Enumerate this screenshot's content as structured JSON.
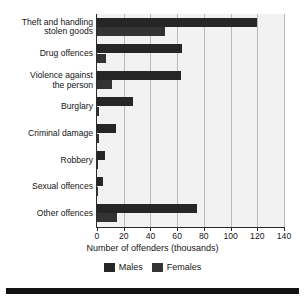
{
  "chart_data": {
    "type": "bar",
    "orientation": "horizontal",
    "title": "",
    "xlabel": "Number of offenders (thousands)",
    "ylabel": "",
    "xlim": [
      0,
      140
    ],
    "xticks": [
      0,
      20,
      40,
      60,
      80,
      100,
      120,
      140
    ],
    "grid": true,
    "legend_position": "bottom",
    "categories": [
      "Theft and handling stolen goods",
      "Drug offences",
      "Violence against the person",
      "Burglary",
      "Criminal damage",
      "Robbery",
      "Sexual offences",
      "Other offences"
    ],
    "series": [
      {
        "name": "Males",
        "color": "#262626",
        "values": [
          120,
          64,
          63,
          27,
          14,
          6,
          4.5,
          75
        ]
      },
      {
        "name": "Females",
        "color": "#333333",
        "values": [
          51,
          6.5,
          11,
          1.2,
          1.5,
          0.7,
          0.2,
          15
        ]
      }
    ]
  },
  "category_labels": [
    [
      "Theft and handling",
      "stolen goods"
    ],
    [
      "Drug offences"
    ],
    [
      "Violence against",
      "the person"
    ],
    [
      "Burglary"
    ],
    [
      "Criminal damage"
    ],
    [
      "Robbery"
    ],
    [
      "Sexual offences"
    ],
    [
      "Other offences"
    ]
  ],
  "axis": {
    "x_title": "Number of offenders (thousands)",
    "tick_labels": [
      "0",
      "20",
      "40",
      "60",
      "80",
      "100",
      "120",
      "140"
    ]
  },
  "legend": {
    "items": [
      {
        "label": "Males"
      },
      {
        "label": "Females"
      }
    ]
  },
  "colors": {
    "males": "#262626",
    "females": "#333333",
    "plot_background": "#f2f2f2",
    "gridline": "#b9b9b9",
    "axis": "#2b2b2b",
    "rule": "#121212"
  }
}
